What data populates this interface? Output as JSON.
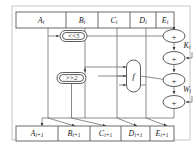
{
  "diagram": {
    "type": "block-diagram",
    "colors": {
      "wire": "#6f6f6f",
      "box_stroke": "#5a5a5a",
      "text": "#1a1a1a",
      "background": "#ffffff"
    },
    "input_registers": [
      {
        "id": "A_in",
        "base": "A",
        "subscript": "i",
        "x": 48
      },
      {
        "id": "B_in",
        "base": "B",
        "subscript": "i",
        "x": 85
      },
      {
        "id": "C_in",
        "base": "C",
        "subscript": "i",
        "x": 117
      },
      {
        "id": "D_in",
        "base": "D",
        "subscript": "i",
        "x": 146
      },
      {
        "id": "E_in",
        "base": "E",
        "subscript": "i",
        "x": 174
      }
    ],
    "output_registers": [
      {
        "id": "A_out",
        "base": "A",
        "subscript": "i+1",
        "x": 42
      },
      {
        "id": "B_out",
        "base": "B",
        "subscript": "i+1",
        "x": 75
      },
      {
        "id": "C_out",
        "base": "C",
        "subscript": "i+1",
        "x": 106
      },
      {
        "id": "D_out",
        "base": "D",
        "subscript": "i+1",
        "x": 137
      },
      {
        "id": "E_out",
        "base": "E",
        "subscript": "i+1",
        "x": 167
      }
    ],
    "operations": [
      {
        "id": "rotl5",
        "label": "<<5",
        "name": "rotate-left-5",
        "x": 48,
        "y": 36
      },
      {
        "id": "rotr2",
        "label": ">>2",
        "name": "rotate-right-2",
        "x": 70,
        "y": 78
      },
      {
        "id": "f_function",
        "label": "f",
        "name": "f-function",
        "x": 133,
        "y": 76
      }
    ],
    "adders": [
      {
        "id": "adder1",
        "label": "+",
        "x": 174,
        "y": 36
      },
      {
        "id": "adder2",
        "label": "+",
        "x": 174,
        "y": 58
      },
      {
        "id": "adder3",
        "label": "+",
        "x": 174,
        "y": 80
      },
      {
        "id": "adder4",
        "label": "+",
        "x": 174,
        "y": 102
      }
    ],
    "constants": [
      {
        "id": "K_const",
        "base": "K",
        "subscript": "i",
        "x": 187,
        "y": 46
      },
      {
        "id": "W_const",
        "base": "W",
        "subscript": "i",
        "x": 187,
        "y": 90
      }
    ]
  }
}
